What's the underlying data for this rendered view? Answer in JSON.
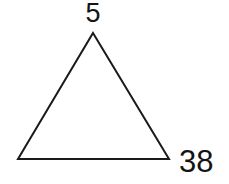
{
  "figure": {
    "kind": "triangle-diagram",
    "background_color": "#ffffff",
    "stroke_color": "#1a1a1a",
    "stroke_width": 2,
    "fill": "none",
    "canvas": {
      "width": 229,
      "height": 184
    },
    "vertices": {
      "apex": {
        "x": 93,
        "y": 33
      },
      "bottom_left": {
        "x": 18,
        "y": 159
      },
      "bottom_right": {
        "x": 169,
        "y": 159
      }
    },
    "polygon_points": "93,33 169,159 18,159"
  },
  "labels": {
    "apex_value": "5",
    "base_right_value": "38",
    "text_color": "#141414"
  }
}
